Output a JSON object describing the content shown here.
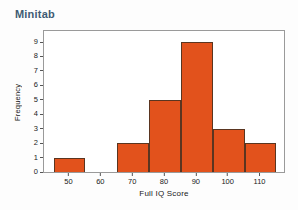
{
  "app": {
    "title": "Minitab"
  },
  "colors": {
    "title_text": "#3f5b73",
    "bar_fill": "#e2521c",
    "bar_stroke": "#5a3520",
    "frame": "#9a9a9a",
    "axis_text": "#1a1a1a",
    "background": "#fdfdfd"
  },
  "chart_data": {
    "type": "bar",
    "title": "",
    "subtitle": "",
    "xlabel": "Full IQ Score",
    "ylabel": "Frequency",
    "xlim": [
      42,
      118
    ],
    "ylim": [
      0,
      9
    ],
    "grid": false,
    "legend": false,
    "bin_width": 10,
    "bin_edges": [
      45,
      55,
      65,
      75,
      85,
      95,
      105,
      115
    ],
    "categories": [
      "45-55",
      "55-65",
      "65-75",
      "75-85",
      "85-95",
      "95-105",
      "105-115"
    ],
    "bin_centers": [
      50,
      60,
      70,
      80,
      90,
      100,
      110
    ],
    "values": [
      1,
      0,
      2,
      5,
      9,
      3,
      2
    ],
    "xticks": [
      50,
      60,
      70,
      80,
      90,
      100,
      110
    ],
    "xticklabels": [
      "50",
      "60",
      "70",
      "80",
      "90",
      "100",
      "110"
    ],
    "yticks": [
      0,
      1,
      2,
      3,
      4,
      5,
      6,
      7,
      8,
      9
    ],
    "yticklabels": [
      "0",
      "1",
      "2",
      "3",
      "4",
      "5",
      "6",
      "7",
      "8",
      "9"
    ]
  }
}
